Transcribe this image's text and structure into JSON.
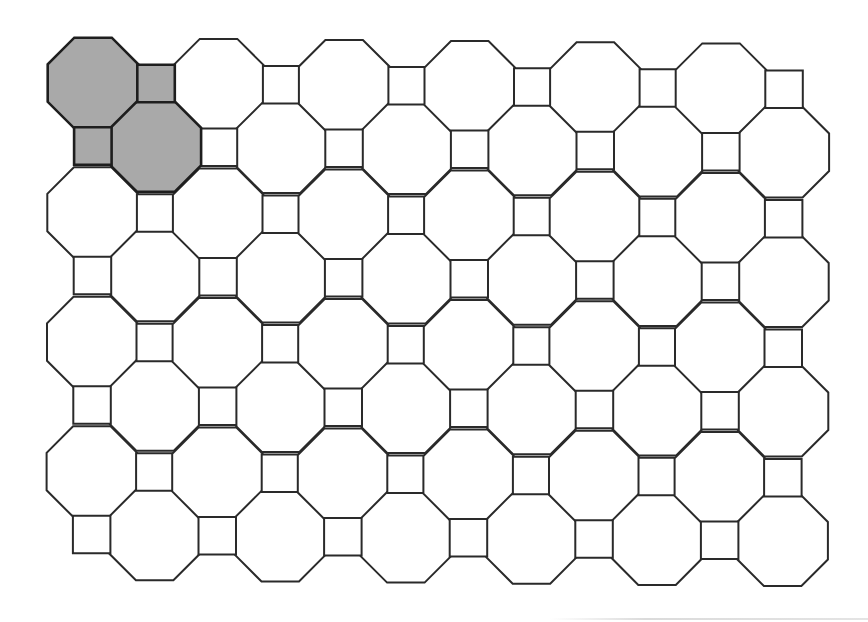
{
  "diagram": {
    "title": "",
    "type": "truncated-square-tiling",
    "canvas": {
      "width": 868,
      "height": 622,
      "background": "#ffffff"
    },
    "colors": {
      "stroke": "#2a2a2a",
      "fill": "#ffffff",
      "highlight_fill": "#a9a9a9",
      "highlight_stroke": "#1e1e1e"
    },
    "stroke_width": 2,
    "highlight_stroke_width": 2.6,
    "octagon_edge": 37.5,
    "grid": {
      "columns": 6,
      "rows": 4,
      "period_x": 125.6,
      "period_y": 129.5,
      "a_origin": [
        93,
        83
      ],
      "b_origin": [
        156,
        146
      ],
      "skew_y_per_x": 0.009,
      "skew_x_per_y": -0.003
    },
    "counts": {
      "octagons_a": 24,
      "octagons_b": 24,
      "squares_h": 24,
      "squares_v": 24
    },
    "highlighted": [
      {
        "kind": "octagon",
        "lattice": "a",
        "col": 0,
        "row": 0
      },
      {
        "kind": "square",
        "lattice": "h",
        "col": 0,
        "row": 0
      },
      {
        "kind": "square",
        "lattice": "v",
        "col": 0,
        "row": 0
      },
      {
        "kind": "octagon",
        "lattice": "b",
        "col": 0,
        "row": 0
      }
    ]
  }
}
